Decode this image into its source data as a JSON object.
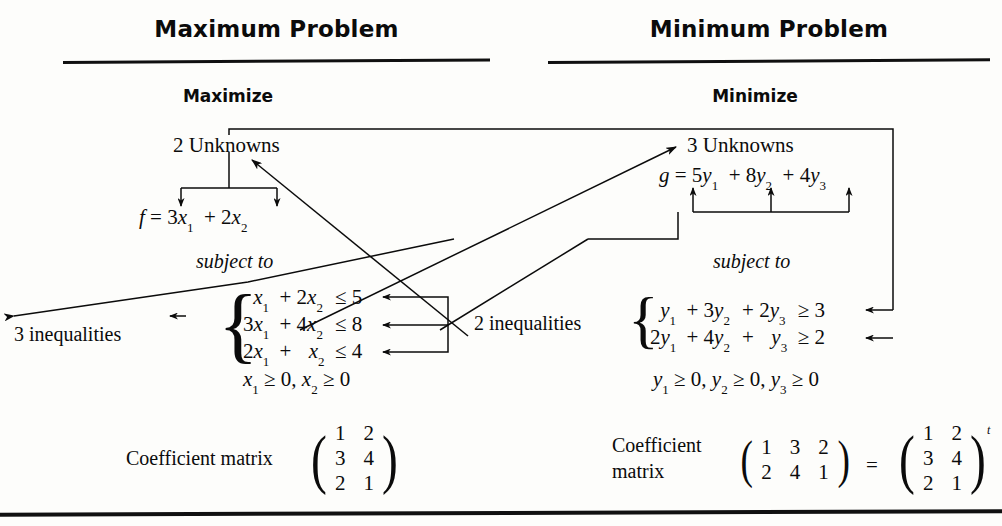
{
  "figure": {
    "caption_hidden": "",
    "columns": [
      {
        "id": "maximum",
        "title": "Maximum Problem",
        "objective_word": "Maximize",
        "unknowns_label": "2 Unknowns",
        "objective": {
          "lhs": "f",
          "eq": "=",
          "terms": [
            {
              "coef": "3",
              "var": "x",
              "sub": "1"
            },
            {
              "coef": "2",
              "var": "x",
              "sub": "2"
            }
          ],
          "plain": "f = 3x₁ + 2x₂"
        },
        "subject_to": "subject to",
        "constraint_count_label": "3 inequalities",
        "constraints": [
          {
            "plain": "x₁ + 2x₂ ≤ 5",
            "rhs": "5",
            "rel": "≤"
          },
          {
            "plain": "3x₁ + 4x₂ ≤ 8",
            "rhs": "8",
            "rel": "≤"
          },
          {
            "plain": "2x₁ + x₂ ≤ 4",
            "rhs": "4",
            "rel": "≤"
          }
        ],
        "nonnegativity": "x₁ ≥ 0, x₂ ≥ 0",
        "matrix_label": "Coefficient matrix",
        "matrix": {
          "rows": [
            [
              "1",
              "2"
            ],
            [
              "3",
              "4"
            ],
            [
              "2",
              "1"
            ]
          ],
          "shape": "3x2"
        }
      },
      {
        "id": "minimum",
        "title": "Minimum Problem",
        "objective_word": "Minimize",
        "unknowns_label": "3 Unknowns",
        "objective": {
          "lhs": "g",
          "eq": "=",
          "terms": [
            {
              "coef": "5",
              "var": "y",
              "sub": "1"
            },
            {
              "coef": "8",
              "var": "y",
              "sub": "2"
            },
            {
              "coef": "4",
              "var": "y",
              "sub": "3"
            }
          ],
          "plain": "g = 5y₁ + 8y₂ + 4y₃"
        },
        "subject_to": "subject to",
        "constraint_count_label": "2 inequalities",
        "constraints": [
          {
            "plain": "y₁ + 3y₂ + 2y₃ ≥ 3",
            "rhs": "3",
            "rel": "≥"
          },
          {
            "plain": "2y₁ + 4y₂ + y₃ ≥ 2",
            "rhs": "2",
            "rel": "≥"
          }
        ],
        "nonnegativity": "y₁ ≥ 0, y₂ ≥ 0, y₃ ≥ 0",
        "matrix_label_line1": "Coefficient",
        "matrix_label_line2": "matrix",
        "matrix": {
          "rows": [
            [
              "1",
              "3",
              "2"
            ],
            [
              "2",
              "4",
              "1"
            ]
          ],
          "shape": "2x3"
        },
        "equals_sign": "=",
        "transpose_matrix": {
          "rows": [
            [
              "1",
              "2"
            ],
            [
              "3",
              "4"
            ],
            [
              "2",
              "1"
            ]
          ],
          "shape": "3x2",
          "exponent": "t"
        }
      }
    ],
    "symbols": {
      "left_brace": "{",
      "left_paren": "(",
      "right_paren": ")",
      "arrow_down": "↓",
      "arrow_up": "↑",
      "arrow_left": "←",
      "arrow_right": "→"
    },
    "colors": {
      "ink": "#0b0b0b",
      "rule": "#101010",
      "background": "#fdfdfb"
    }
  }
}
